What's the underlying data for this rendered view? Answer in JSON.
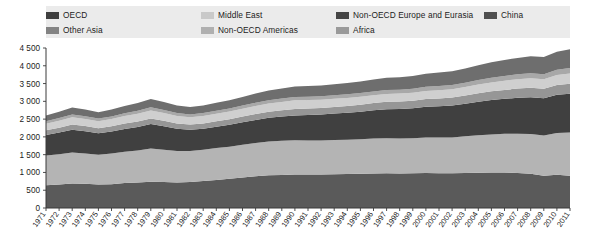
{
  "legend": {
    "rows": [
      [
        {
          "label": "OECD",
          "color": "#3f3f3f",
          "x": 0
        },
        {
          "label": "Middle East",
          "color": "#c9c9c9",
          "x": 155
        },
        {
          "label": "Non-OECD Europe and Eurasia",
          "color": "#454545",
          "x": 290
        },
        {
          "label": "China",
          "color": "#4f4f4f",
          "x": 438
        }
      ],
      [
        {
          "label": "Other Asia",
          "color": "#838383",
          "x": 0
        },
        {
          "label": "Non-OECD Americas",
          "color": "#b0b0b0",
          "x": 155
        },
        {
          "label": "Africa",
          "color": "#9a9a9a",
          "x": 290
        }
      ]
    ]
  },
  "axes": {
    "y_ticks": [
      "0",
      "500",
      "1 000",
      "1 500",
      "2 000",
      "2 500",
      "3 000",
      "3 500",
      "4 000",
      "4 500"
    ],
    "y_min": 0,
    "y_max": 4500,
    "y_step": 500,
    "x_ticks": [
      "1971",
      "1972",
      "1973",
      "1974",
      "1975",
      "1976",
      "1977",
      "1978",
      "1979",
      "1980",
      "1981",
      "1982",
      "1983",
      "1984",
      "1985",
      "1986",
      "1987",
      "1988",
      "1989",
      "1990",
      "1991",
      "1992",
      "1993",
      "1994",
      "1995",
      "1996",
      "1997",
      "1998",
      "1999",
      "2000",
      "2001",
      "2002",
      "2003",
      "2004",
      "2005",
      "2006",
      "2007",
      "2008",
      "2009",
      "2010",
      "2011"
    ]
  },
  "chart_data": {
    "type": "area",
    "title": "",
    "xlabel": "",
    "ylabel": "",
    "ylim": [
      0,
      4500
    ],
    "grid": false,
    "legend_position": "top",
    "stacked": true,
    "x": [
      1971,
      1972,
      1973,
      1974,
      1975,
      1976,
      1977,
      1978,
      1979,
      1980,
      1981,
      1982,
      1983,
      1984,
      1985,
      1986,
      1987,
      1988,
      1989,
      1990,
      1991,
      1992,
      1993,
      1994,
      1995,
      1996,
      1997,
      1998,
      1999,
      2000,
      2001,
      2002,
      2003,
      2004,
      2005,
      2006,
      2007,
      2008,
      2009,
      2010,
      2011
    ],
    "series": [
      {
        "name": "OECD",
        "color": "#5a5a5a",
        "values": [
          640,
          660,
          690,
          680,
          660,
          670,
          700,
          720,
          740,
          730,
          720,
          730,
          760,
          790,
          820,
          860,
          890,
          920,
          930,
          940,
          940,
          945,
          950,
          955,
          960,
          970,
          975,
          970,
          975,
          985,
          980,
          975,
          985,
          990,
          995,
          995,
          985,
          960,
          905,
          935,
          905
        ]
      },
      {
        "name": "Other Asia",
        "color": "#b4b4b4",
        "values": [
          840,
          855,
          870,
          850,
          835,
          860,
          880,
          900,
          930,
          905,
          880,
          870,
          880,
          895,
          905,
          920,
          935,
          950,
          960,
          965,
          960,
          955,
          960,
          965,
          975,
          985,
          990,
          985,
          985,
          995,
          1000,
          1010,
          1030,
          1055,
          1075,
          1090,
          1105,
          1120,
          1135,
          1175,
          1215
        ]
      },
      {
        "name": "Middle East",
        "color": "#404040",
        "values": [
          570,
          605,
          640,
          630,
          610,
          625,
          645,
          660,
          690,
          665,
          630,
          600,
          590,
          600,
          615,
          630,
          650,
          665,
          680,
          700,
          715,
          730,
          745,
          760,
          775,
          795,
          815,
          830,
          845,
          865,
          880,
          895,
          915,
          940,
          965,
          985,
          1010,
          1035,
          1045,
          1075,
          1095
        ]
      },
      {
        "name": "Non-OECD Americas",
        "color": "#969696",
        "values": [
          135,
          140,
          150,
          145,
          140,
          145,
          150,
          155,
          160,
          155,
          150,
          148,
          150,
          155,
          158,
          162,
          168,
          172,
          176,
          180,
          182,
          185,
          188,
          192,
          196,
          200,
          205,
          208,
          212,
          218,
          222,
          226,
          232,
          240,
          246,
          252,
          258,
          264,
          266,
          274,
          280
        ]
      },
      {
        "name": "Non-OECD Europe and Eurasia",
        "color": "#cfcfcf",
        "values": [
          185,
          195,
          205,
          200,
          195,
          200,
          210,
          215,
          225,
          218,
          210,
          205,
          208,
          212,
          216,
          222,
          228,
          234,
          238,
          242,
          238,
          232,
          228,
          224,
          222,
          222,
          224,
          224,
          226,
          230,
          232,
          235,
          240,
          246,
          252,
          258,
          264,
          270,
          270,
          280,
          288
        ]
      },
      {
        "name": "Africa",
        "color": "#a8a8a8",
        "values": [
          70,
          74,
          78,
          76,
          74,
          76,
          79,
          82,
          86,
          84,
          81,
          80,
          81,
          83,
          85,
          87,
          90,
          92,
          94,
          96,
          97,
          99,
          101,
          103,
          105,
          108,
          110,
          112,
          114,
          117,
          119,
          121,
          124,
          128,
          131,
          134,
          138,
          141,
          143,
          148,
          152
        ]
      },
      {
        "name": "China",
        "color": "#6e6e6e",
        "values": [
          160,
          175,
          195,
          190,
          182,
          192,
          206,
          218,
          238,
          225,
          210,
          205,
          212,
          222,
          232,
          244,
          258,
          270,
          280,
          292,
          298,
          302,
          308,
          315,
          322,
          332,
          342,
          348,
          356,
          368,
          376,
          386,
          400,
          418,
          434,
          448,
          462,
          478,
          486,
          508,
          528
        ]
      }
    ]
  }
}
